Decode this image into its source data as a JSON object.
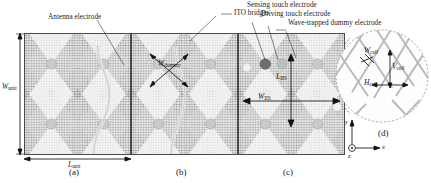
{
  "figure": {
    "background_color": "#ffffff",
    "line_color": "#222222",
    "mesh_dark_color": "#8a8a8a",
    "mesh_light_color": "#d9d9d9",
    "sensing_dot_color": "#6e6e6e",
    "driving_dot_color": "#b4b4b4",
    "dummy_dot_color": "#c9c9c9"
  },
  "callouts": [
    {
      "id": "antenna-electrode",
      "label": "Antenna electrode"
    },
    {
      "id": "ito-bridges",
      "label": "ITO bridges"
    },
    {
      "id": "sensing-touch-electrode",
      "label": "Sensing touch electrode"
    },
    {
      "id": "driving-touch-electrode",
      "label": "Driving touch electrode"
    },
    {
      "id": "wave-trapped-dummy-electrode",
      "label": "Wave-trapped dummy electrode"
    }
  ],
  "dimensions": [
    {
      "id": "w-unit",
      "symbol": "W",
      "sub": "unit",
      "panel": "a",
      "orientation": "vertical"
    },
    {
      "id": "l-unit",
      "symbol": "L",
      "sub": "unit",
      "panel": "a",
      "orientation": "horizontal"
    },
    {
      "id": "w-dummy",
      "symbol": "W",
      "sub": "dummy",
      "panel": "b",
      "orientation": "diagonal"
    },
    {
      "id": "l-iis",
      "symbol": "L",
      "sub": "IIS",
      "panel": "c",
      "orientation": "vertical"
    },
    {
      "id": "w-iis",
      "symbol": "W",
      "sub": "IIS",
      "panel": "c",
      "orientation": "horizontal"
    },
    {
      "id": "w-cell",
      "symbol": "W",
      "sub": "cell",
      "panel": "d",
      "orientation": "diagonal"
    },
    {
      "id": "v-cell",
      "symbol": "V",
      "sub": "cell",
      "panel": "d",
      "orientation": "vertical"
    },
    {
      "id": "h-cell",
      "symbol": "H",
      "sub": "cell",
      "panel": "d",
      "orientation": "horizontal"
    }
  ],
  "panels": [
    {
      "id": "a",
      "label": "(a)"
    },
    {
      "id": "b",
      "label": "(b)"
    },
    {
      "id": "c",
      "label": "(c)"
    },
    {
      "id": "d",
      "label": "(d)"
    }
  ],
  "axes": {
    "x_label": "x",
    "y_label": "y",
    "z_label": "z",
    "z_glyph": "out-of-page-dot"
  }
}
